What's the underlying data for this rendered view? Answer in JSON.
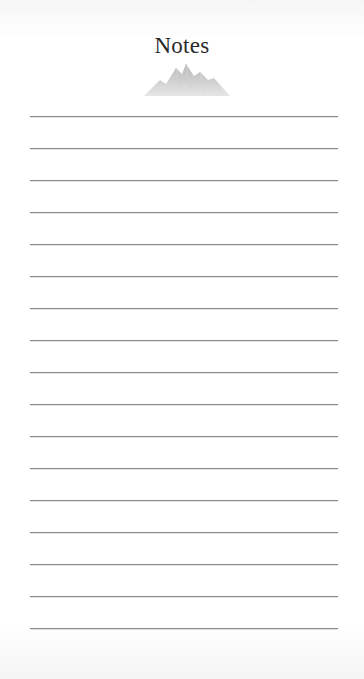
{
  "notepad": {
    "title": "Notes",
    "decoration": "mountains-icon",
    "line_count": 17,
    "line_color": "#8c8c8c",
    "title_color": "#2a2a2a"
  }
}
